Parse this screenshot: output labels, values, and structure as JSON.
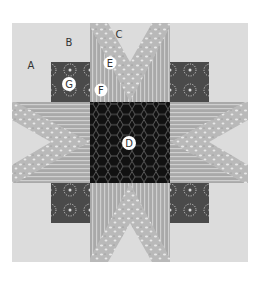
{
  "figure": {
    "labels": {
      "A": "A",
      "B": "B",
      "C": "C",
      "D": "D",
      "E": "E",
      "F": "F",
      "G": "G"
    },
    "colors": {
      "page": "#ffffff",
      "background_fabric": "#dcdcdc",
      "star_point_print": "#b9b9b9",
      "stripe_fabric": "#a9a9a9",
      "stripe_line": "#cfcfcf",
      "corner_square_dark": "#4a4a4a",
      "center_black": "#111111",
      "hex_line": "#6a6a6a"
    }
  }
}
